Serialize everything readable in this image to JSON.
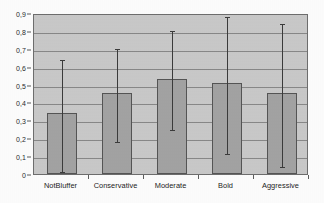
{
  "chart_data": {
    "type": "bar",
    "title": "",
    "subtitle": "",
    "xlabel": "",
    "ylabel": "",
    "categories": [
      "NotBluffer",
      "Conservative",
      "Moderate",
      "Bold",
      "Aggressive"
    ],
    "values": [
      0.34,
      0.455,
      0.53,
      0.51,
      0.455
    ],
    "error_upper": [
      0.65,
      0.71,
      0.81,
      0.89,
      0.85
    ],
    "error_lower": [
      0.02,
      0.19,
      0.255,
      0.125,
      0.05
    ],
    "ylim": [
      0,
      0.9
    ],
    "ytick_values": [
      0,
      0.1,
      0.2,
      0.3,
      0.4,
      0.5,
      0.6,
      0.7,
      0.8,
      0.9
    ],
    "ytick_labels": [
      "0",
      "0,1",
      "0,2",
      "0,3",
      "0,4",
      "0,5",
      "0,6",
      "0,7",
      "0,8",
      "0,9"
    ],
    "grid": true,
    "legend": false,
    "legend_position": "none",
    "series": [
      {
        "name": "mean",
        "values": [
          0.34,
          0.455,
          0.53,
          0.51,
          0.455
        ]
      }
    ],
    "colors": {
      "bar_fill": "#a3a3a3",
      "bar_border": "#555555",
      "plot_background": "#c9c9c9",
      "gridline": "#7d7d7d",
      "errorbar": "#3c3c3c",
      "axis": "#6e6e6e",
      "text": "#232323",
      "figure_background": "#fdfdfd"
    }
  }
}
